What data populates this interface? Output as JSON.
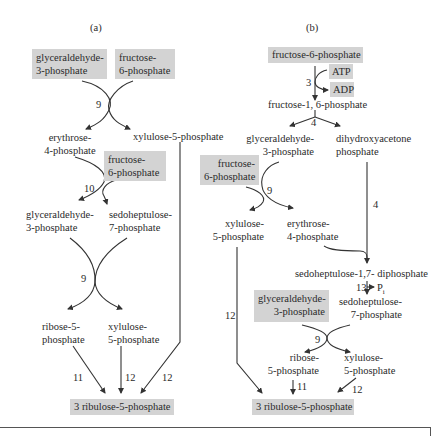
{
  "panel_a": {
    "label": "(a)",
    "inputs": [
      {
        "line1": "glyceraldehyde-",
        "line2": "3-phosphate"
      },
      {
        "line1": "fructose-",
        "line2": "6-phosphate"
      }
    ],
    "step1_enzyme": "9",
    "erythrose": {
      "line1": "erythrose-",
      "line2": "4-phosphate"
    },
    "xylulose_top": "xylulose-5-phosphate",
    "fructose2": {
      "line1": "fructose-",
      "line2": "6-phosphate"
    },
    "step2_enzyme": "10",
    "g3p": {
      "line1": "glyceraldehyde-",
      "line2": "3-phosphate"
    },
    "s7p": {
      "line1": "sedoheptulose-",
      "line2": "7-phosphate"
    },
    "step3_enzyme": "9",
    "r5p": {
      "line1": "ribose-5-",
      "line2": "phosphate"
    },
    "x5p": {
      "line1": "xylulose-",
      "line2": "5-phosphate"
    },
    "enzyme_11": "11",
    "enzyme_12a": "12",
    "enzyme_12b": "12",
    "product": "3 ribulose-5-phosphate"
  },
  "panel_b": {
    "label": "(b)",
    "input": "fructose-6-phosphate",
    "atp": "ATP",
    "adp": "ADP",
    "enzyme_3": "3",
    "f16bp": "fructose-1, 6-phosphate",
    "enzyme_4a": "4",
    "g3p": {
      "line1": "glyceraldehyde-",
      "line2": "3-phosphate"
    },
    "dhap": {
      "line1": "dihydroxyacetone",
      "line2": "phosphate"
    },
    "fructose2": {
      "line1": "fructose-",
      "line2": "6-phosphate"
    },
    "enzyme_9a": "9",
    "x5p_a": {
      "line1": "xylulose-",
      "line2": "5-phosphate"
    },
    "e4p": {
      "line1": "erythrose-",
      "line2": "4-phosphate"
    },
    "enzyme_4b": "4",
    "s17bp": "sedoheptulose-1,7- diphosphate",
    "enzyme_13": "13",
    "pi": "P",
    "pi_sub": "i",
    "g3p2": {
      "line1": "glyceraldehyde-",
      "line2": "3-phosphate"
    },
    "s7p": {
      "line1": "sedoheptulose-",
      "line2": "7-phosphate"
    },
    "enzyme_12_left": "12",
    "enzyme_9b": "9",
    "r5p": {
      "line1": "ribose-",
      "line2": "5-phosphate"
    },
    "x5p_b": {
      "line1": "xylulose-",
      "line2": "5-phosphate"
    },
    "enzyme_11": "11",
    "enzyme_12_right": "12",
    "product": "3 ribulose-5-phosphate"
  },
  "colors": {
    "box_fill": "#d3d3d3",
    "line": "#333333",
    "text": "#2a2a2a"
  }
}
